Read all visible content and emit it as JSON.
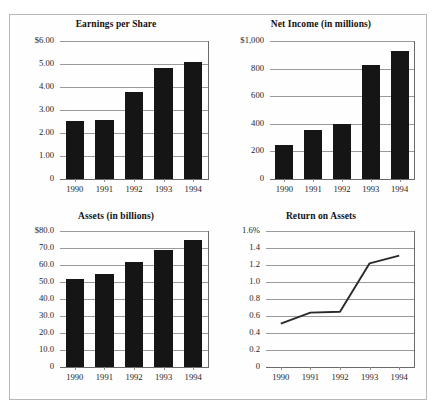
{
  "figure": {
    "panels": [
      {
        "id": "earnings-per-share",
        "title": "Earnings per Share",
        "chart_type": "bar"
      },
      {
        "id": "net-income",
        "title": "Net Income (in millions)",
        "chart_type": "bar"
      },
      {
        "id": "assets",
        "title": "Assets (in billions)",
        "chart_type": "bar"
      },
      {
        "id": "return-on-assets",
        "title": "Return on Assets",
        "chart_type": "line"
      }
    ]
  },
  "chart_data": [
    {
      "type": "bar",
      "title": "Earnings per Share",
      "xlabel": "",
      "ylabel": "",
      "categories": [
        "1990",
        "1991",
        "1992",
        "1993",
        "1994"
      ],
      "values": [
        2.52,
        2.57,
        3.78,
        4.84,
        5.1
      ],
      "ylim": [
        0,
        6.0
      ],
      "yticks": [
        0,
        1.0,
        2.0,
        3.0,
        4.0,
        5.0,
        6.0
      ],
      "ytick_labels": [
        "0",
        "1.00",
        "2.00",
        "3.00",
        "4.00",
        "5.00",
        "$6.00"
      ],
      "grid": true,
      "legend": "none",
      "bar_color": "#151515"
    },
    {
      "type": "bar",
      "title": "Net Income (in millions)",
      "xlabel": "",
      "ylabel": "",
      "categories": [
        "1990",
        "1991",
        "1992",
        "1993",
        "1994"
      ],
      "values": [
        250,
        355,
        400,
        825,
        930
      ],
      "ylim": [
        0,
        1000
      ],
      "yticks": [
        0,
        200,
        400,
        600,
        800,
        1000
      ],
      "ytick_labels": [
        "0",
        "200",
        "400",
        "600",
        "800",
        "$1,000"
      ],
      "grid": true,
      "legend": "none",
      "bar_color": "#151515"
    },
    {
      "type": "bar",
      "title": "Assets (in billions)",
      "xlabel": "",
      "ylabel": "",
      "categories": [
        "1990",
        "1991",
        "1992",
        "1993",
        "1994"
      ],
      "values": [
        52.0,
        54.5,
        61.5,
        69.0,
        74.5
      ],
      "ylim": [
        0,
        80.0
      ],
      "yticks": [
        0,
        10.0,
        20.0,
        30.0,
        40.0,
        50.0,
        60.0,
        70.0,
        80.0
      ],
      "ytick_labels": [
        "0",
        "10.0",
        "20.0",
        "30.0",
        "40.0",
        "50.0",
        "60.0",
        "70.0",
        "$80.0"
      ],
      "grid": true,
      "legend": "none",
      "bar_color": "#151515"
    },
    {
      "type": "line",
      "title": "Return on Assets",
      "xlabel": "",
      "ylabel": "",
      "categories": [
        "1990",
        "1991",
        "1992",
        "1993",
        "1994"
      ],
      "values": [
        0.51,
        0.64,
        0.65,
        1.22,
        1.31
      ],
      "ylim": [
        0,
        1.6
      ],
      "yticks": [
        0,
        0.2,
        0.4,
        0.6,
        0.8,
        1.0,
        1.2,
        1.4,
        1.6
      ],
      "ytick_labels": [
        "0",
        "0.2",
        "0.4",
        "0.6",
        "0.8",
        "1.0",
        "1.2",
        "1.4",
        "1.6%"
      ],
      "grid": true,
      "legend": "none",
      "line_color": "#2a2a2a"
    }
  ]
}
